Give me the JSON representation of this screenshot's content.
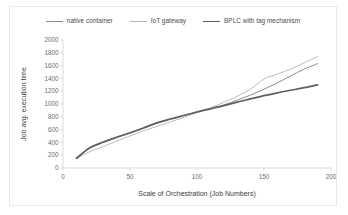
{
  "chart_data": {
    "type": "line",
    "title": "",
    "xlabel": "Scale of Orchestration (Job Numbers)",
    "ylabel": "Job avg. execution time",
    "xlim": [
      0,
      200
    ],
    "ylim": [
      0,
      2000
    ],
    "xticks": [
      0,
      50,
      100,
      150,
      200
    ],
    "yticks": [
      0,
      200,
      400,
      600,
      800,
      1000,
      1200,
      1400,
      1600,
      1800,
      2000
    ],
    "grid": false,
    "legend_position": "top",
    "x": [
      10,
      20,
      30,
      40,
      50,
      60,
      70,
      80,
      90,
      100,
      110,
      120,
      130,
      140,
      150,
      160,
      170,
      180,
      190
    ],
    "series": [
      {
        "name": "native container",
        "color": "#8c8c8c",
        "width": 1.0,
        "values": [
          150,
          310,
          400,
          475,
          545,
          620,
          700,
          760,
          820,
          880,
          930,
          985,
          1060,
          1140,
          1230,
          1330,
          1440,
          1545,
          1630
        ]
      },
      {
        "name": "IoT gateway",
        "color": "#b5b5b5",
        "width": 0.9,
        "values": [
          150,
          255,
          335,
          420,
          500,
          580,
          650,
          720,
          790,
          865,
          940,
          1025,
          1120,
          1235,
          1390,
          1470,
          1545,
          1645,
          1740
        ]
      },
      {
        "name": "BPLC with tag mechanism",
        "color": "#5f5f5f",
        "width": 1.7,
        "values": [
          150,
          315,
          405,
          480,
          550,
          625,
          705,
          765,
          820,
          875,
          925,
          975,
          1030,
          1080,
          1130,
          1175,
          1215,
          1255,
          1300
        ]
      }
    ]
  },
  "legend": {
    "items": [
      {
        "label": "native container"
      },
      {
        "label": "IoT gateway"
      },
      {
        "label": "BPLC with tag mechanism"
      }
    ]
  },
  "axes": {
    "x_title": "Scale of Orchestration (Job Numbers)",
    "y_title": "Job avg. execution time",
    "x_tick_labels": [
      "0",
      "50",
      "100",
      "150",
      "200"
    ],
    "y_tick_labels": [
      "0",
      "200",
      "400",
      "600",
      "800",
      "1000",
      "1200",
      "1400",
      "1600",
      "1800",
      "2000"
    ]
  },
  "colors": {
    "background": "#ffffff",
    "frame_border": "#e9e9e9",
    "axis": "#c8c8c8",
    "tick_text": "#6e6e6e",
    "title_text": "#3d3d3d"
  }
}
